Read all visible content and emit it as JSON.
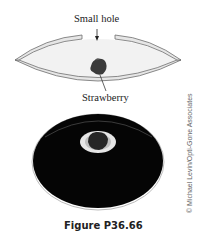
{
  "diagram": {
    "labels": {
      "hole": "Small hole",
      "object": "Strawberry"
    },
    "components": {
      "mirror": "concave-mirror-pair",
      "object_icon": "strawberry-icon",
      "photo": "mirage-photo"
    },
    "colors": {
      "mirror_fill": "#e8e8e8",
      "mirror_stroke": "#777777",
      "cavity": "#f3f3f3",
      "strawberry": "#3a3a3a",
      "photo_bg": "#050505",
      "photo_ring": "#e6e6e6"
    }
  },
  "caption": "Figure P36.66",
  "credit": "© Michael Levin/Opti-Gone Associates"
}
